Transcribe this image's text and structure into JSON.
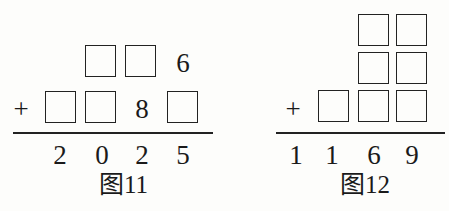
{
  "figure11": {
    "row1": [
      "",
      "",
      "6"
    ],
    "row2": [
      "",
      "",
      "8",
      ""
    ],
    "operator": "+",
    "sum": [
      "2",
      "0",
      "2",
      "5"
    ],
    "caption": "图11"
  },
  "figure12": {
    "row1": [
      "",
      ""
    ],
    "row2": [
      "",
      ""
    ],
    "row3": [
      "",
      "",
      ""
    ],
    "operator": "+",
    "sum": [
      "1",
      "1",
      "6",
      "9"
    ],
    "caption": "图12"
  }
}
